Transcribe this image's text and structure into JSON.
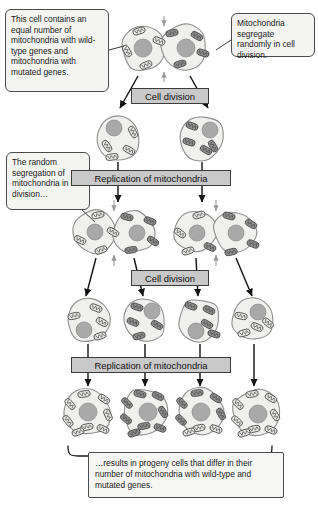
{
  "figure": {
    "background": "#ffffff"
  },
  "colors": {
    "cell_fill": "#f0f0ee",
    "cell_stroke": "#8f8f8f",
    "nucleus_fill": "#a9a9a9",
    "mito_wildtype_fill": "#e6e6e4",
    "mito_mutated_fill": "#8e8e8e",
    "mito_stroke": "#4d4d4d",
    "label_fill": "#c9c9c9",
    "callout_fill": "#f4f4f2",
    "arrow": "#111111",
    "gray_arrow": "#9a9a9a"
  },
  "callouts": {
    "initial": "This cell contains an equal number of mitochondria with wild-type genes and mitochondria with mutated genes.",
    "random_segregation": "Mitochondria segregate randomly in cell division.",
    "left_mid": "The random segregation of mitochondria in cell division…",
    "result": "…results in progeny cells that differ in their number of mitochondria with wild-type and mutated genes."
  },
  "process_labels": {
    "cell_division_1": "Cell division",
    "replication_1": "Replication of mitochondria",
    "cell_division_2": "Cell division",
    "replication_2": "Replication of mitochondria"
  },
  "chart_data": {
    "type": "diagram",
    "legend": [
      {
        "name": "wild-type mitochondrion",
        "fill": "#e6e6e4"
      },
      {
        "name": "mutated mitochondrion",
        "fill": "#8e8e8e"
      }
    ],
    "rows": [
      {
        "row": 1,
        "stage": "parent cell undergoing division",
        "cells": [
          {
            "id": "parent-left-lobe",
            "cx": 144,
            "cy": 48,
            "r": 23,
            "nucleus": {
              "cx": 143,
              "cy": 48,
              "r": 9
            },
            "mitochondria": [
              {
                "x": 139,
                "y": 31,
                "a": -18,
                "type": "wild"
              },
              {
                "x": 159,
                "y": 41,
                "a": 22,
                "type": "wild"
              },
              {
                "x": 127,
                "y": 51,
                "a": 62,
                "type": "wild"
              },
              {
                "x": 146,
                "y": 65,
                "a": -22,
                "type": "wild"
              }
            ]
          },
          {
            "id": "parent-right-lobe",
            "cx": 184,
            "cy": 48,
            "r": 23,
            "nucleus": {
              "cx": 186,
              "cy": 48,
              "r": 9
            },
            "mitochondria": [
              {
                "x": 172,
                "y": 33,
                "a": -12,
                "type": "mutated"
              },
              {
                "x": 197,
                "y": 36,
                "a": 28,
                "type": "mutated"
              },
              {
                "x": 203,
                "y": 53,
                "a": 18,
                "type": "mutated"
              },
              {
                "x": 180,
                "y": 64,
                "a": -16,
                "type": "mutated"
              }
            ]
          }
        ]
      },
      {
        "row": 2,
        "stage": "two daughter cells after first division",
        "cells": [
          {
            "id": "r2-c1",
            "cx": 118,
            "cy": 138,
            "r": 22,
            "nucleus": {
              "cx": 114,
              "cy": 128,
              "r": 8
            },
            "mitochondria": [
              {
                "x": 133,
                "y": 132,
                "a": 62,
                "type": "wild"
              },
              {
                "x": 107,
                "y": 146,
                "a": 55,
                "type": "wild"
              },
              {
                "x": 129,
                "y": 150,
                "a": 28,
                "type": "wild"
              },
              {
                "x": 112,
                "y": 157,
                "a": -8,
                "type": "wild"
              }
            ]
          },
          {
            "id": "r2-c2",
            "cx": 202,
            "cy": 138,
            "r": 22,
            "nucleus": {
              "cx": 210,
              "cy": 130,
              "r": 8
            },
            "mitochondria": [
              {
                "x": 192,
                "y": 126,
                "a": 20,
                "type": "mutated"
              },
              {
                "x": 189,
                "y": 142,
                "a": 18,
                "type": "mutated"
              },
              {
                "x": 206,
                "y": 150,
                "a": 30,
                "type": "mutated"
              },
              {
                "x": 213,
                "y": 146,
                "a": 60,
                "type": "mutated"
              }
            ]
          }
        ]
      },
      {
        "row": 3,
        "stage": "cells after mitochondrial replication, dividing again",
        "cells": [
          {
            "id": "r3-left-lobe-a",
            "cx": 95,
            "cy": 232,
            "r": 21,
            "nucleus": {
              "cx": 95,
              "cy": 232,
              "r": 8
            },
            "mitochondria": [
              {
                "x": 98,
                "y": 215,
                "a": -14,
                "type": "wild"
              },
              {
                "x": 80,
                "y": 240,
                "a": 26,
                "type": "wild"
              },
              {
                "x": 113,
                "y": 232,
                "a": 30,
                "type": "wild"
              },
              {
                "x": 101,
                "y": 250,
                "a": -20,
                "type": "wild"
              }
            ]
          },
          {
            "id": "r3-left-lobe-b",
            "cx": 134,
            "cy": 232,
            "r": 21,
            "nucleus": {
              "cx": 137,
              "cy": 233,
              "r": 8
            },
            "mitochondria": [
              {
                "x": 127,
                "y": 217,
                "a": 14,
                "type": "mutated"
              },
              {
                "x": 150,
                "y": 221,
                "a": 22,
                "type": "mutated"
              },
              {
                "x": 153,
                "y": 241,
                "a": 34,
                "type": "mutated"
              },
              {
                "x": 131,
                "y": 250,
                "a": -10,
                "type": "mutated"
              }
            ]
          },
          {
            "id": "r3-right-lobe-a",
            "cx": 196,
            "cy": 232,
            "r": 21,
            "nucleus": {
              "cx": 197,
              "cy": 233,
              "r": 8
            },
            "mitochondria": [
              {
                "x": 199,
                "y": 215,
                "a": -16,
                "type": "wild"
              },
              {
                "x": 180,
                "y": 233,
                "a": 36,
                "type": "wild"
              },
              {
                "x": 188,
                "y": 251,
                "a": -18,
                "type": "wild"
              },
              {
                "x": 210,
                "y": 247,
                "a": 24,
                "type": "mutated"
              }
            ]
          },
          {
            "id": "r3-right-lobe-b",
            "cx": 235,
            "cy": 232,
            "r": 21,
            "nucleus": {
              "cx": 236,
              "cy": 233,
              "r": 8
            },
            "mitochondria": [
              {
                "x": 229,
                "y": 216,
                "a": 16,
                "type": "mutated"
              },
              {
                "x": 251,
                "y": 224,
                "a": 30,
                "type": "mutated"
              },
              {
                "x": 253,
                "y": 244,
                "a": 22,
                "type": "mutated"
              },
              {
                "x": 231,
                "y": 252,
                "a": -12,
                "type": "mutated"
              }
            ]
          }
        ]
      },
      {
        "row": 4,
        "stage": "four progeny cells after second division",
        "cells": [
          {
            "id": "r4-c1",
            "cx": 88,
            "cy": 320,
            "r": 21,
            "nucleus": {
              "cx": 84,
              "cy": 330,
              "r": 8
            },
            "mitochondria": [
              {
                "x": 96,
                "y": 308,
                "a": 22,
                "type": "wild"
              },
              {
                "x": 74,
                "y": 316,
                "a": -12,
                "type": "wild"
              },
              {
                "x": 102,
                "y": 322,
                "a": 28,
                "type": "wild"
              },
              {
                "x": 100,
                "y": 336,
                "a": -18,
                "type": "wild"
              }
            ]
          },
          {
            "id": "r4-c2",
            "cx": 145,
            "cy": 320,
            "r": 21,
            "nucleus": {
              "cx": 152,
              "cy": 311,
              "r": 8
            },
            "mitochondria": [
              {
                "x": 137,
                "y": 307,
                "a": 18,
                "type": "mutated"
              },
              {
                "x": 133,
                "y": 322,
                "a": 24,
                "type": "mutated"
              },
              {
                "x": 157,
                "y": 325,
                "a": 30,
                "type": "mutated"
              },
              {
                "x": 139,
                "y": 336,
                "a": -14,
                "type": "mutated"
              }
            ]
          },
          {
            "id": "r4-c3",
            "cx": 199,
            "cy": 320,
            "r": 21,
            "nucleus": {
              "cx": 196,
              "cy": 331,
              "r": 8
            },
            "mitochondria": [
              {
                "x": 191,
                "y": 306,
                "a": 20,
                "type": "mutated"
              },
              {
                "x": 209,
                "y": 310,
                "a": 26,
                "type": "mutated"
              },
              {
                "x": 207,
                "y": 324,
                "a": 30,
                "type": "mutated"
              },
              {
                "x": 214,
                "y": 334,
                "a": 18,
                "type": "mutated"
              }
            ]
          },
          {
            "id": "r4-c4",
            "cx": 253,
            "cy": 320,
            "r": 21,
            "nucleus": {
              "cx": 258,
              "cy": 312,
              "r": 8
            },
            "mitochondria": [
              {
                "x": 241,
                "y": 316,
                "a": 12,
                "type": "wild"
              },
              {
                "x": 257,
                "y": 327,
                "a": 24,
                "type": "wild"
              },
              {
                "x": 244,
                "y": 333,
                "a": -16,
                "type": "wild"
              },
              {
                "x": 268,
                "y": 323,
                "a": 40,
                "type": "wild"
              }
            ]
          }
        ]
      },
      {
        "row": 5,
        "stage": "final progeny cells after second replication",
        "cells": [
          {
            "id": "r5-c1",
            "cx": 88,
            "cy": 412,
            "r": 23,
            "nucleus": {
              "cx": 88,
              "cy": 412,
              "r": 9
            },
            "mitochondria": [
              {
                "x": 84,
                "y": 394,
                "a": -10,
                "type": "wild"
              },
              {
                "x": 104,
                "y": 399,
                "a": 34,
                "type": "wild"
              },
              {
                "x": 70,
                "y": 404,
                "a": 48,
                "type": "wild"
              },
              {
                "x": 108,
                "y": 415,
                "a": 66,
                "type": "wild"
              },
              {
                "x": 68,
                "y": 421,
                "a": 52,
                "type": "wild"
              },
              {
                "x": 87,
                "y": 427,
                "a": -12,
                "type": "wild"
              },
              {
                "x": 103,
                "y": 429,
                "a": 24,
                "type": "wild"
              },
              {
                "x": 78,
                "y": 432,
                "a": -20,
                "type": "wild"
              }
            ]
          },
          {
            "id": "r5-c2",
            "cx": 145,
            "cy": 412,
            "r": 23,
            "nucleus": {
              "cx": 148,
              "cy": 412,
              "r": 9
            },
            "mitochondria": [
              {
                "x": 140,
                "y": 394,
                "a": 14,
                "type": "mutated"
              },
              {
                "x": 158,
                "y": 396,
                "a": 26,
                "type": "mutated"
              },
              {
                "x": 127,
                "y": 403,
                "a": 44,
                "type": "mutated"
              },
              {
                "x": 163,
                "y": 412,
                "a": 58,
                "type": "mutated"
              },
              {
                "x": 126,
                "y": 419,
                "a": 40,
                "type": "mutated"
              },
              {
                "x": 144,
                "y": 426,
                "a": -10,
                "type": "mutated"
              },
              {
                "x": 160,
                "y": 428,
                "a": 22,
                "type": "mutated"
              },
              {
                "x": 134,
                "y": 433,
                "a": -18,
                "type": "mutated"
              }
            ]
          },
          {
            "id": "r5-c3",
            "cx": 201,
            "cy": 412,
            "r": 23,
            "nucleus": {
              "cx": 201,
              "cy": 412,
              "r": 9
            },
            "mitochondria": [
              {
                "x": 197,
                "y": 393,
                "a": -8,
                "type": "mutated"
              },
              {
                "x": 216,
                "y": 398,
                "a": 32,
                "type": "mutated"
              },
              {
                "x": 182,
                "y": 403,
                "a": 46,
                "type": "mutated"
              },
              {
                "x": 221,
                "y": 414,
                "a": 62,
                "type": "mutated"
              },
              {
                "x": 181,
                "y": 420,
                "a": 44,
                "type": "mutated"
              },
              {
                "x": 199,
                "y": 428,
                "a": -12,
                "type": "wild"
              },
              {
                "x": 216,
                "y": 429,
                "a": 22,
                "type": "wild"
              },
              {
                "x": 189,
                "y": 432,
                "a": -18,
                "type": "wild"
              }
            ]
          },
          {
            "id": "r5-c4",
            "cx": 256,
            "cy": 412,
            "r": 23,
            "nucleus": {
              "cx": 258,
              "cy": 414,
              "r": 9
            },
            "mitochondria": [
              {
                "x": 252,
                "y": 394,
                "a": -10,
                "type": "wild"
              },
              {
                "x": 271,
                "y": 398,
                "a": 30,
                "type": "wild"
              },
              {
                "x": 238,
                "y": 404,
                "a": 46,
                "type": "wild"
              },
              {
                "x": 275,
                "y": 415,
                "a": 60,
                "type": "wild"
              },
              {
                "x": 237,
                "y": 421,
                "a": 42,
                "type": "wild"
              },
              {
                "x": 254,
                "y": 429,
                "a": -12,
                "type": "wild"
              },
              {
                "x": 271,
                "y": 430,
                "a": 20,
                "type": "wild"
              },
              {
                "x": 244,
                "y": 433,
                "a": -18,
                "type": "wild"
              }
            ]
          }
        ]
      }
    ],
    "arrows": [
      {
        "from": "parent cell",
        "to": "r2-c1",
        "kind": "black"
      },
      {
        "from": "parent cell",
        "to": "r2-c2",
        "kind": "black"
      },
      {
        "from": "r2-c1",
        "to": "r3-left",
        "kind": "black"
      },
      {
        "from": "r2-c2",
        "to": "r3-right",
        "kind": "black"
      },
      {
        "from": "r3-left",
        "to": "r4-c1",
        "kind": "black"
      },
      {
        "from": "r3-left",
        "to": "r4-c2",
        "kind": "black"
      },
      {
        "from": "r3-right",
        "to": "r4-c3",
        "kind": "black"
      },
      {
        "from": "r3-right",
        "to": "r4-c4",
        "kind": "black"
      },
      {
        "from": "r4-c1",
        "to": "r5-c1",
        "kind": "black"
      },
      {
        "from": "r4-c2",
        "to": "r5-c2",
        "kind": "black"
      },
      {
        "from": "r4-c3",
        "to": "r5-c3",
        "kind": "black"
      },
      {
        "from": "r4-c4",
        "to": "r5-c4",
        "kind": "black"
      }
    ]
  }
}
